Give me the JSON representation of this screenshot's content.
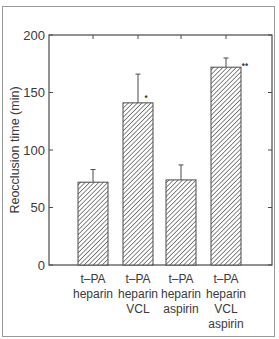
{
  "chart_data": {
    "type": "bar",
    "title": "",
    "xlabel": "",
    "ylabel": "Reocclusion time (min)",
    "ylim": [
      0,
      200
    ],
    "yticks": [
      0,
      50,
      100,
      150,
      200
    ],
    "grid": false,
    "legend": null,
    "categories": [
      [
        "t–PA",
        "heparin"
      ],
      [
        "t–PA",
        "heparin",
        "VCL"
      ],
      [
        "t–PA",
        "heparin",
        "aspirin"
      ],
      [
        "t–PA",
        "heparin",
        "VCL",
        "aspirin"
      ]
    ],
    "values": [
      72,
      141,
      74,
      172
    ],
    "errors": [
      11,
      25,
      13,
      8
    ],
    "annotations": [
      "",
      "*",
      "",
      "**"
    ],
    "bar_fill": "diagonal-hatch"
  },
  "colors": {
    "axis": "#4a4a4a",
    "hatch": "#555555",
    "text": "#3a3a3a",
    "border": "#9a9a9a"
  }
}
